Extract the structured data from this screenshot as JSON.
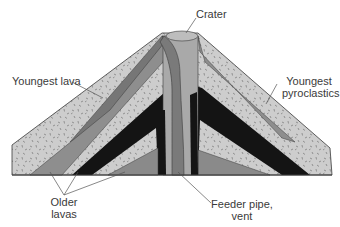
{
  "diagram": {
    "labels": {
      "crater": "Crater",
      "youngest_lava": "Youngest lava",
      "youngest_pyroclastics_1": "Youngest",
      "youngest_pyroclastics_2": "pyroclastics",
      "older_lavas_1": "Older",
      "older_lavas_2": "lavas",
      "feeder_pipe_1": "Feeder pipe,",
      "feeder_pipe_2": "vent"
    },
    "colors": {
      "pyroclastic_fill": "#c9c9c9",
      "lava_mid": "#8a8a8a",
      "lava_dark": "#6f6f6f",
      "older_lava_black": "#141414",
      "pipe_light": "#a8a8a8",
      "outline": "#3a3a3a"
    }
  }
}
